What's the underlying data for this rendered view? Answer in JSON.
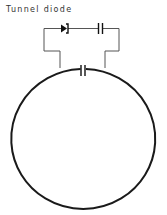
{
  "title": "Tunnel diode",
  "diagram": {
    "type": "circuit",
    "components": [
      {
        "name": "tunnel-diode",
        "label": "Tunnel diode"
      },
      {
        "name": "series-capacitor"
      },
      {
        "name": "coupling-capacitor"
      },
      {
        "name": "loop-resonator"
      }
    ],
    "colors": {
      "stroke": "#1a1a1a",
      "wire": "#555555"
    }
  }
}
